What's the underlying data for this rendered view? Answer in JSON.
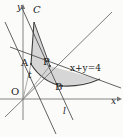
{
  "figure": {
    "axes": {
      "x_label": "x",
      "y_label": "y",
      "origin_label": "O"
    },
    "labels": {
      "curve_c": "C",
      "point_a": "A",
      "point_p": "P",
      "point_b": "B",
      "segment_t": "t",
      "line_l": "l",
      "line_equation": "x+y=4"
    },
    "colors": {
      "background": "#fbfbfa",
      "stroke": "#3c3c3c",
      "axis": "#6a6a6a",
      "shaded_fill": "#cccccc",
      "label": "#1a1a1a"
    },
    "geometry": {
      "origin": [
        23,
        99
      ],
      "point_a": [
        31,
        64
      ],
      "point_p": [
        50,
        66
      ],
      "point_b": [
        62,
        86
      ],
      "curve_c_top": [
        34,
        22
      ],
      "line_l_equation": "x+y=4"
    }
  }
}
